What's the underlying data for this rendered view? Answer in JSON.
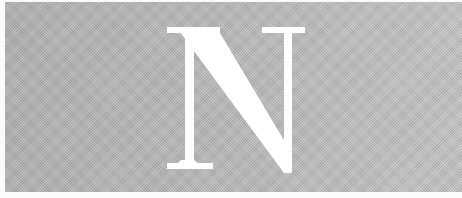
{
  "image": {
    "letter": "N",
    "letter_color": "#ffffff",
    "background_color": "#b4b4b4",
    "border_color": "#fbfbfb"
  }
}
